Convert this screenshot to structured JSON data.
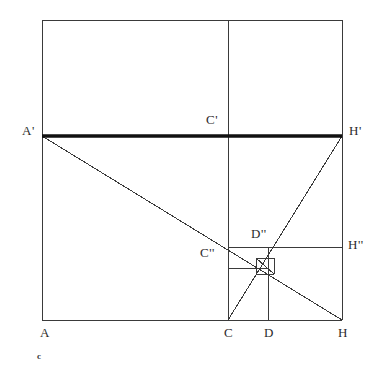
{
  "figure": {
    "caption": "c",
    "background_color": "#ffffff",
    "stroke_color": "#3a3a3a",
    "thick_stroke_color": "#111111",
    "labels": [
      {
        "id": "A",
        "text": "A",
        "x": 40,
        "y": 326
      },
      {
        "id": "C",
        "text": "C",
        "x": 224,
        "y": 326
      },
      {
        "id": "D",
        "text": "D",
        "x": 264,
        "y": 326
      },
      {
        "id": "H",
        "text": "H",
        "x": 338,
        "y": 326
      },
      {
        "id": "A-prime",
        "text": "A'",
        "x": 22,
        "y": 124
      },
      {
        "id": "C-prime",
        "text": "C'",
        "x": 206,
        "y": 113
      },
      {
        "id": "H-prime",
        "text": "H'",
        "x": 349,
        "y": 124
      },
      {
        "id": "C-double",
        "text": "C''",
        "x": 200,
        "y": 246
      },
      {
        "id": "D-double",
        "text": "D''",
        "x": 251,
        "y": 227
      },
      {
        "id": "H-double",
        "text": "H''",
        "x": 348,
        "y": 238
      }
    ],
    "points": {
      "A": {
        "x": 42,
        "y": 320
      },
      "C": {
        "x": 228,
        "y": 320
      },
      "D": {
        "x": 268,
        "y": 320
      },
      "H": {
        "x": 342,
        "y": 320
      },
      "A_prime": {
        "x": 42,
        "y": 136
      },
      "C_prime": {
        "x": 228,
        "y": 136
      },
      "H_prime": {
        "x": 342,
        "y": 136
      },
      "C_double": {
        "x": 228,
        "y": 247
      },
      "D_double": {
        "x": 268,
        "y": 247
      },
      "H_double": {
        "x": 342,
        "y": 247
      },
      "top_left": {
        "x": 42,
        "y": 20
      },
      "top_right": {
        "x": 342,
        "y": 20
      }
    },
    "segments": [
      {
        "id": "outer-square-left",
        "x1": 42,
        "y1": 20,
        "x2": 42,
        "y2": 320,
        "weight": "thin"
      },
      {
        "id": "outer-square-top",
        "x1": 42,
        "y1": 20,
        "x2": 342,
        "y2": 20,
        "weight": "thin"
      },
      {
        "id": "outer-square-right",
        "x1": 342,
        "y1": 20,
        "x2": 342,
        "y2": 320,
        "weight": "thin"
      },
      {
        "id": "outer-square-bottom",
        "x1": 42,
        "y1": 320,
        "x2": 342,
        "y2": 320,
        "weight": "thin"
      },
      {
        "id": "vertical-through-C",
        "x1": 228,
        "y1": 20,
        "x2": 228,
        "y2": 320,
        "weight": "thin"
      },
      {
        "id": "vertical-through-D",
        "x1": 268,
        "y1": 247,
        "x2": 268,
        "y2": 320,
        "weight": "thin"
      },
      {
        "id": "line-A-prime-H-prime",
        "x1": 42,
        "y1": 136,
        "x2": 342,
        "y2": 136,
        "weight": "thick"
      },
      {
        "id": "line-C-double-H-double",
        "x1": 228,
        "y1": 247,
        "x2": 342,
        "y2": 247,
        "weight": "thin"
      },
      {
        "id": "diagonal-A-prime-to-H",
        "x1": 42,
        "y1": 136,
        "x2": 342,
        "y2": 320,
        "weight": "thin"
      },
      {
        "id": "diagonal-H-prime-to-C",
        "x1": 342,
        "y1": 136,
        "x2": 228,
        "y2": 320,
        "weight": "thin"
      },
      {
        "id": "small-square-top",
        "x1": 228,
        "y1": 247,
        "x2": 268,
        "y2": 247,
        "weight": "thin"
      },
      {
        "id": "small-square-bottom",
        "x1": 228,
        "y1": 268,
        "x2": 268,
        "y2": 268,
        "weight": "thin"
      },
      {
        "id": "small-square-left",
        "x1": 228,
        "y1": 247,
        "x2": 228,
        "y2": 268,
        "weight": "thin"
      },
      {
        "id": "inner-square-left",
        "x1": 256,
        "y1": 258,
        "x2": 256,
        "y2": 274,
        "weight": "thin"
      },
      {
        "id": "inner-square-right",
        "x1": 274,
        "y1": 258,
        "x2": 274,
        "y2": 274,
        "weight": "thin"
      },
      {
        "id": "inner-square-top",
        "x1": 256,
        "y1": 258,
        "x2": 274,
        "y2": 258,
        "weight": "thin"
      },
      {
        "id": "inner-square-bottom",
        "x1": 256,
        "y1": 274,
        "x2": 274,
        "y2": 274,
        "weight": "thin"
      },
      {
        "id": "inner-diagonal",
        "x1": 256,
        "y1": 258,
        "x2": 274,
        "y2": 274,
        "weight": "thin"
      }
    ]
  }
}
